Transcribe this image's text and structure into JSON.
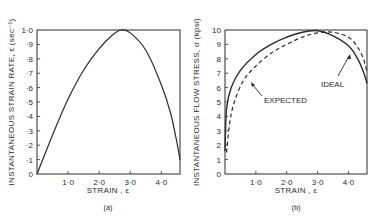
{
  "chart_data": [
    {
      "type": "line",
      "panel": "(a)",
      "title": "",
      "xlabel": "STRAIN , ε",
      "ylabel": "INSTANTANEOUS  STRAIN  RATE, ε̇ (sec⁻¹)",
      "xlim": [
        0,
        4.6
      ],
      "ylim": [
        0,
        1.0
      ],
      "x_ticks": [
        "1·0",
        "2·0",
        "3·0",
        "4·0"
      ],
      "x_tick_values": [
        1.0,
        2.0,
        3.0,
        4.0
      ],
      "y_ticks": [
        "0",
        "·1",
        "·2",
        "·3",
        "·4",
        "·5",
        "·6",
        "·7",
        "·8",
        "·9",
        "1·0"
      ],
      "y_tick_values": [
        0,
        0.1,
        0.2,
        0.3,
        0.4,
        0.5,
        0.6,
        0.7,
        0.8,
        0.9,
        1.0
      ],
      "grid": false,
      "series": [
        {
          "name": "strain rate",
          "style": "solid",
          "x": [
            0.0,
            0.5,
            1.0,
            1.5,
            2.0,
            2.4,
            2.7,
            3.0,
            3.5,
            4.0,
            4.3,
            4.5,
            4.6
          ],
          "y": [
            0.0,
            0.27,
            0.52,
            0.72,
            0.87,
            0.96,
            1.0,
            0.98,
            0.86,
            0.62,
            0.42,
            0.22,
            0.1
          ]
        }
      ]
    },
    {
      "type": "line",
      "panel": "(b)",
      "title": "",
      "xlabel": "STRAIN , ε",
      "ylabel": "INSTANTANEOUS  FLOW  STRESS, σ (kpsi)",
      "xlim": [
        0,
        4.6
      ],
      "ylim": [
        0,
        10
      ],
      "x_ticks": [
        "1·0",
        "2·0",
        "3·0",
        "4·0"
      ],
      "x_tick_values": [
        1.0,
        2.0,
        3.0,
        4.0
      ],
      "y_ticks": [
        "0",
        "1",
        "2",
        "3",
        "4",
        "5",
        "6",
        "7",
        "8",
        "9",
        "10"
      ],
      "y_tick_values": [
        0,
        1,
        2,
        3,
        4,
        5,
        6,
        7,
        8,
        9,
        10
      ],
      "grid": false,
      "legend": "annotations with arrows",
      "annotations": [
        {
          "text": "EXPECTED",
          "points_to": "dashed curve near ε≈0.9, σ≈7.3"
        },
        {
          "text": "IDEAL",
          "points_to": "solid curve near ε≈4.1, σ≈8.8"
        }
      ],
      "series": [
        {
          "name": "IDEAL",
          "style": "solid",
          "x": [
            0.0,
            0.05,
            0.2,
            0.5,
            1.0,
            1.5,
            2.0,
            2.5,
            3.0,
            3.5,
            4.0,
            4.3,
            4.5,
            4.6
          ],
          "y": [
            1.6,
            4.5,
            6.0,
            7.2,
            8.3,
            9.0,
            9.5,
            9.85,
            9.95,
            9.6,
            8.9,
            8.0,
            7.0,
            6.3
          ]
        },
        {
          "name": "EXPECTED",
          "style": "dashed",
          "x": [
            0.05,
            0.15,
            0.3,
            0.6,
            1.0,
            1.5,
            2.0,
            2.5,
            3.0,
            3.5,
            4.0,
            4.3,
            4.5,
            4.6
          ],
          "y": [
            1.5,
            3.5,
            5.0,
            6.5,
            7.5,
            8.4,
            9.0,
            9.5,
            9.8,
            9.85,
            9.5,
            8.8,
            7.9,
            7.0
          ]
        }
      ]
    }
  ],
  "panels": {
    "a": {
      "caption": "(a)",
      "xlabel": "STRAIN , ε",
      "ylabel": "INSTANTANEOUS  STRAIN  RATE, ε̇  (sec⁻¹)"
    },
    "b": {
      "caption": "(b)",
      "xlabel": "STRAIN , ε",
      "ylabel": "INSTANTANEOUS  FLOW  STRESS, σ (kpsi)",
      "anno_expected": "EXPECTED",
      "anno_ideal": "IDEAL"
    }
  },
  "colors": {
    "ink": "#2a2a2a",
    "background": "#ffffff"
  }
}
